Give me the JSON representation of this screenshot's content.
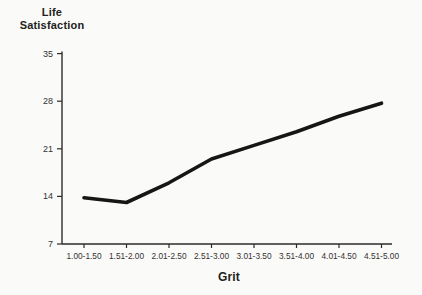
{
  "chart_data": {
    "type": "line",
    "title": "",
    "xlabel": "Grit",
    "ylabel": "Life Satisfaction",
    "categories": [
      "1.00-1.50",
      "1.51-2.00",
      "2.01-2.50",
      "2.51-3.00",
      "3.01-3.50",
      "3.51-4.00",
      "4.01-4.50",
      "4.51-5.00"
    ],
    "values": [
      13.8,
      13.1,
      16.0,
      19.5,
      21.5,
      23.5,
      25.8,
      27.7
    ],
    "y_ticks": [
      7,
      14,
      21,
      28,
      35
    ],
    "ylim": [
      7,
      35
    ],
    "grid": false,
    "legend": false,
    "line_color": "#161616",
    "axis_color": "#2b2b29",
    "tick_label_color": "#333331",
    "background": "#fafaf8"
  }
}
